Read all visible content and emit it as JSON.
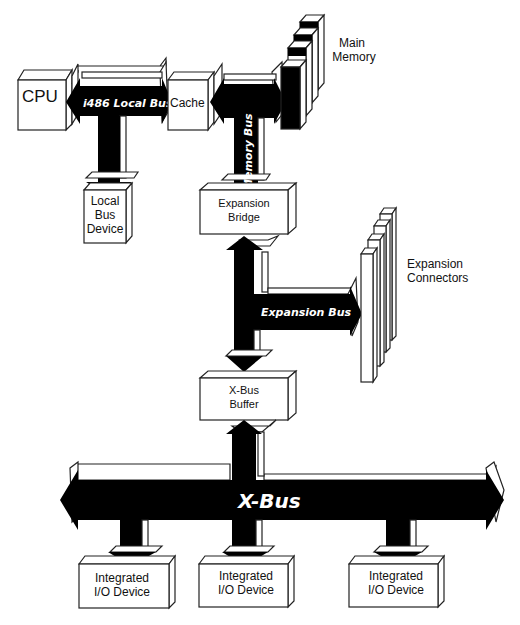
{
  "diagram": {
    "nodes": {
      "cpu": "CPU",
      "cache": "Cache",
      "main_memory_line1": "Main",
      "main_memory_line2": "Memory",
      "local_bus_device_line1": "Local",
      "local_bus_device_line2": "Bus",
      "local_bus_device_line3": "Device",
      "expansion_bridge_line1": "Expansion",
      "expansion_bridge_line2": "Bridge",
      "expansion_connectors_line1": "Expansion",
      "expansion_connectors_line2": "Connectors",
      "xbus_buffer_line1": "X-Bus",
      "xbus_buffer_line2": "Buffer",
      "io_devices": [
        {
          "line1": "Integrated",
          "line2": "I/O Device"
        },
        {
          "line1": "Integrated",
          "line2": "I/O Device"
        },
        {
          "line1": "Integrated",
          "line2": "I/O Device"
        }
      ]
    },
    "buses": {
      "local_bus": "i486  Local  Bus",
      "memory_bus": "Memory  Bus",
      "expansion_bus": "Expansion  Bus",
      "x_bus": "X-Bus"
    },
    "colors": {
      "bus_fill": "#000000",
      "box_fill": "#ffffff",
      "stroke": "#222222"
    }
  }
}
